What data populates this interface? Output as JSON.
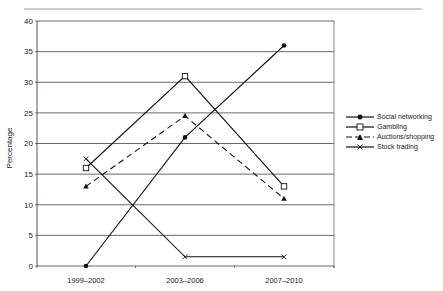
{
  "chart_data": {
    "type": "line",
    "title": "",
    "xlabel": "",
    "ylabel": "Percentage",
    "ylim": [
      0,
      40
    ],
    "yticks": [
      0,
      5,
      10,
      15,
      20,
      25,
      30,
      35,
      40
    ],
    "grid": true,
    "legend_position": "right",
    "categories": [
      "1999–2002",
      "2003–2006",
      "2007–2010"
    ],
    "series": [
      {
        "name": "Social networking",
        "marker": "filled-circle",
        "line": "solid",
        "values": [
          0,
          21,
          36
        ]
      },
      {
        "name": "Gambling",
        "marker": "open-square",
        "line": "solid",
        "values": [
          16,
          31,
          13
        ]
      },
      {
        "name": "Auctions/shopping",
        "marker": "filled-triangle",
        "line": "dashed",
        "values": [
          13,
          24.5,
          11
        ]
      },
      {
        "name": "Stock trading",
        "marker": "x-cross",
        "line": "solid",
        "values": [
          17.5,
          1.5,
          1.5
        ]
      }
    ]
  },
  "labels": {
    "ylabel": "Percentage",
    "x": [
      "1999–2002",
      "2003–2006",
      "2007–2010"
    ],
    "y": [
      "0",
      "5",
      "10",
      "15",
      "20",
      "25",
      "30",
      "35",
      "40"
    ]
  },
  "legend": [
    {
      "label": "Social networking"
    },
    {
      "label": "Gambling"
    },
    {
      "label": "Auctions/shopping"
    },
    {
      "label": "Stock trading"
    }
  ]
}
